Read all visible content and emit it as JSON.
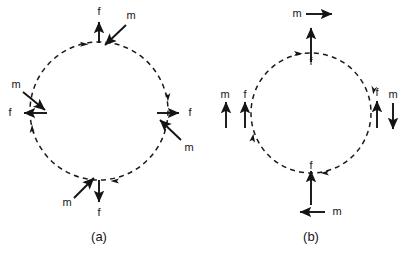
{
  "figure": {
    "type": "physics-free-body-diagram",
    "background_color": "#ffffff",
    "ink_color": "#161616",
    "panels": [
      {
        "id": "a",
        "caption": "(a)",
        "circle": {
          "cx": 99,
          "cy": 111,
          "r": 69,
          "style": "dashed",
          "circulation": "clockwise"
        },
        "description": "Dashed circular loop with four stations; at each station a straight force arrow f and an oblique moment arrow m.",
        "stations": [
          {
            "position": "top",
            "force": {
              "label": "f",
              "direction": "up",
              "label_x": 99,
              "label_y": 12
            },
            "moment": {
              "label": "m",
              "direction": "down-left",
              "label_x": 131,
              "label_y": 16
            },
            "tangent_arrow": "right"
          },
          {
            "position": "left",
            "force": {
              "label": "f",
              "direction": "left",
              "label_x": 10,
              "label_y": 113
            },
            "moment": {
              "label": "m",
              "direction": "down-right",
              "label_x": 16,
              "label_y": 85
            },
            "tangent_arrow": "up"
          },
          {
            "position": "right",
            "force": {
              "label": "f",
              "direction": "right",
              "label_x": 190,
              "label_y": 113
            },
            "moment": {
              "label": "m",
              "direction": "up-left",
              "label_x": 189,
              "label_y": 148
            },
            "tangent_arrow": "down"
          },
          {
            "position": "bottom",
            "force": {
              "label": "f",
              "direction": "down",
              "label_x": 99,
              "label_y": 213
            },
            "moment": {
              "label": "m",
              "direction": "up-right",
              "label_x": 67,
              "label_y": 203
            },
            "tangent_arrow": "left"
          }
        ]
      },
      {
        "id": "b",
        "caption": "(b)",
        "circle": {
          "cx": 311,
          "cy": 113,
          "r": 60,
          "style": "dashed",
          "circulation": "clockwise"
        },
        "description": "Dashed circular loop with four stations; at each station a vertical force arrow f and a separate moment arrow m.",
        "stations": [
          {
            "position": "top",
            "force": {
              "label": "f",
              "direction": "up",
              "label_x": 311,
              "label_y": 60
            },
            "moment": {
              "label": "m",
              "direction": "right",
              "label_x": 297,
              "label_y": 14
            },
            "tangent_arrow": "right"
          },
          {
            "position": "left",
            "force": {
              "label": "f",
              "direction": "up",
              "label_x": 245,
              "label_y": 95
            },
            "moment": {
              "label": "m",
              "direction": "up",
              "label_x": 225,
              "label_y": 95
            },
            "tangent_arrow": "up"
          },
          {
            "position": "right",
            "force": {
              "label": "f",
              "direction": "up",
              "label_x": 377,
              "label_y": 93
            },
            "moment": {
              "label": "m",
              "direction": "down",
              "label_x": 393,
              "label_y": 95
            },
            "tangent_arrow": "down"
          },
          {
            "position": "bottom",
            "force": {
              "label": "f",
              "direction": "up",
              "label_x": 311,
              "label_y": 166
            },
            "moment": {
              "label": "m",
              "direction": "left",
              "label_x": 337,
              "label_y": 212
            },
            "tangent_arrow": "left"
          }
        ]
      }
    ]
  }
}
